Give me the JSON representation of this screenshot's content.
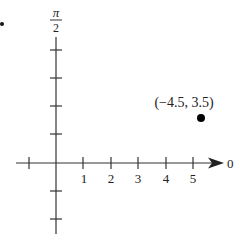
{
  "diagram": {
    "type": "polar-coordinate-plot",
    "vertical_axis_label_numerator": "π",
    "vertical_axis_label_denominator": "2",
    "horizontal_axis_end_label": "0",
    "x_tick_labels": [
      "1",
      "2",
      "3",
      "4",
      "5"
    ],
    "point": {
      "label": "(−4.5, 3.5)",
      "r": -4.5,
      "theta": 3.5
    },
    "colors": {
      "axis": "#333333",
      "point": "#000000",
      "text": "#222222"
    }
  }
}
